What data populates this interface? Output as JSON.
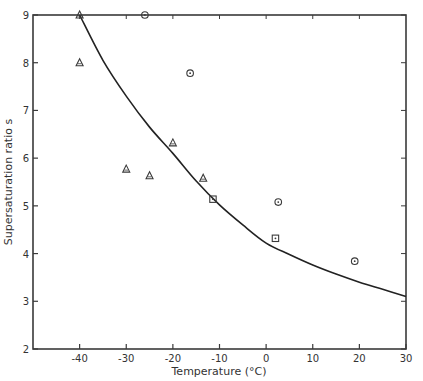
{
  "chart_data": {
    "type": "scatter",
    "title": "",
    "xlabel": "Temperature (°C)",
    "ylabel": "Supersaturation ratio s",
    "xlim": [
      -50,
      30
    ],
    "ylim": [
      2,
      9
    ],
    "x_ticks": [
      -40,
      -30,
      -20,
      -10,
      0,
      10,
      20,
      30
    ],
    "x_tick_labels": [
      "-40",
      "-30",
      "-20",
      "-10",
      "0",
      "10",
      "20",
      "30"
    ],
    "y_ticks": [
      2,
      3,
      4,
      5,
      6,
      7,
      8,
      9
    ],
    "y_tick_labels": [
      "2",
      "3",
      "4",
      "5",
      "6",
      "7",
      "8",
      "9"
    ],
    "grid": false,
    "legend": null,
    "series": [
      {
        "name": "triangles",
        "marker": "triangle",
        "points": [
          {
            "x": -40,
            "y": 9.0
          },
          {
            "x": -40,
            "y": 8.0
          },
          {
            "x": -30,
            "y": 5.77
          },
          {
            "x": -25,
            "y": 5.63
          },
          {
            "x": -20,
            "y": 6.32
          },
          {
            "x": -13.5,
            "y": 5.58
          }
        ]
      },
      {
        "name": "squares",
        "marker": "square",
        "points": [
          {
            "x": -11.4,
            "y": 5.14
          },
          {
            "x": 2,
            "y": 4.32
          }
        ]
      },
      {
        "name": "circles",
        "marker": "circle",
        "points": [
          {
            "x": -26,
            "y": 9.0
          },
          {
            "x": -16.3,
            "y": 7.78
          },
          {
            "x": 2.6,
            "y": 5.08
          },
          {
            "x": 19,
            "y": 3.84
          }
        ]
      },
      {
        "name": "curve",
        "type": "line",
        "x": [
          -40,
          -35,
          -30,
          -25,
          -20,
          -15,
          -10,
          -5,
          0,
          5,
          10,
          15,
          20,
          25,
          30
        ],
        "y": [
          9.0,
          8.05,
          7.3,
          6.65,
          6.1,
          5.52,
          5.02,
          4.6,
          4.22,
          3.98,
          3.76,
          3.57,
          3.4,
          3.25,
          3.1
        ]
      }
    ]
  }
}
